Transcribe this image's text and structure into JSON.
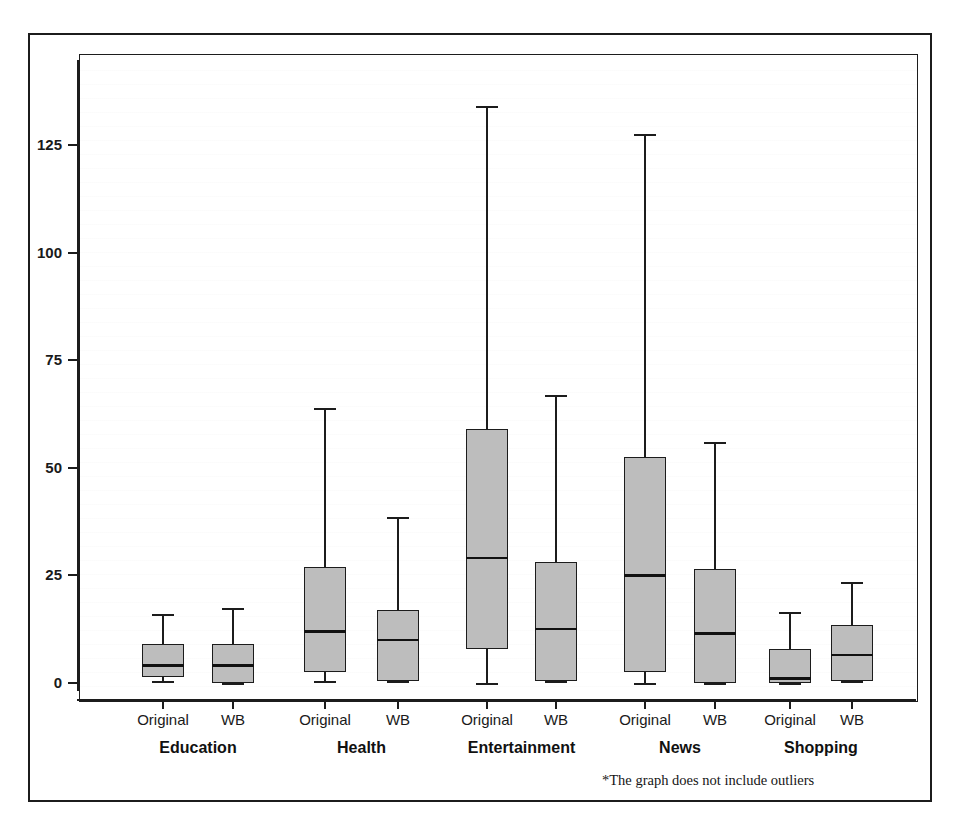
{
  "figure": {
    "footnote": "*The graph does not include outliers",
    "box_fill_color": "#bdbdbd",
    "line_color": "#1c1c1c"
  },
  "chart_data": {
    "type": "box",
    "title": "",
    "xlabel": "",
    "ylabel": "",
    "ylim": [
      -3,
      143
    ],
    "yticks": [
      0,
      25,
      50,
      75,
      100,
      125
    ],
    "ytick_labels": [
      "0",
      "25",
      "50",
      "75",
      "100",
      "125"
    ],
    "grid": false,
    "legend": "none",
    "note": "*The graph does not include outliers",
    "groups": [
      "Education",
      "Health",
      "Entertainment",
      "News",
      "Shopping"
    ],
    "conditions": [
      "Original",
      "WB"
    ],
    "boxes": [
      {
        "group": "Education",
        "condition": "Original",
        "whisker_low": 0.5,
        "q1": 1.5,
        "median": 4,
        "q3": 9,
        "whisker_high": 16
      },
      {
        "group": "Education",
        "condition": "WB",
        "whisker_low": 0,
        "q1": 0,
        "median": 4,
        "q3": 9,
        "whisker_high": 17.5
      },
      {
        "group": "Health",
        "condition": "Original",
        "whisker_low": 0.5,
        "q1": 2.5,
        "median": 12,
        "q3": 27,
        "whisker_high": 64
      },
      {
        "group": "Health",
        "condition": "WB",
        "whisker_low": 0.5,
        "q1": 0.5,
        "median": 10,
        "q3": 17,
        "whisker_high": 38.5
      },
      {
        "group": "Entertainment",
        "condition": "Original",
        "whisker_low": 0,
        "q1": 8,
        "median": 29,
        "q3": 59,
        "whisker_high": 134
      },
      {
        "group": "Entertainment",
        "condition": "WB",
        "whisker_low": 0.5,
        "q1": 0.5,
        "median": 12.5,
        "q3": 28,
        "whisker_high": 67
      },
      {
        "group": "News",
        "condition": "Original",
        "whisker_low": 0,
        "q1": 2.5,
        "median": 25,
        "q3": 52.5,
        "whisker_high": 127.5
      },
      {
        "group": "News",
        "condition": "WB",
        "whisker_low": 0,
        "q1": 0,
        "median": 11.5,
        "q3": 26.5,
        "whisker_high": 56
      },
      {
        "group": "Shopping",
        "condition": "Original",
        "whisker_low": 0,
        "q1": 0,
        "median": 1,
        "q3": 8,
        "whisker_high": 16.5
      },
      {
        "group": "Shopping",
        "condition": "WB",
        "whisker_low": 0.5,
        "q1": 0.5,
        "median": 6.5,
        "q3": 13.5,
        "whisker_high": 23.5
      }
    ]
  }
}
